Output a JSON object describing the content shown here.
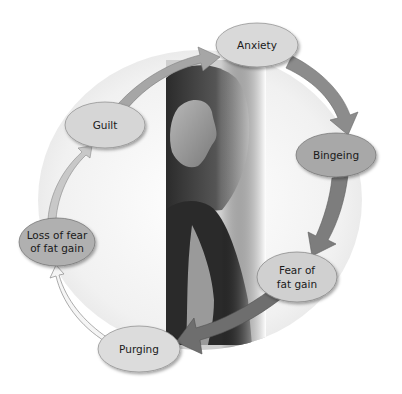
{
  "diagram": {
    "type": "cycle",
    "nodes": [
      {
        "id": "anxiety",
        "label": "Anxiety",
        "lines": [
          "Anxiety"
        ],
        "fill": "#d9d9d9"
      },
      {
        "id": "bingeing",
        "label": "Bingeing",
        "lines": [
          "Bingeing"
        ],
        "fill": "#a8a8a8"
      },
      {
        "id": "fear",
        "label": "Fear of fat gain",
        "lines": [
          "Fear of",
          "fat gain"
        ],
        "fill": "#d0d0d0"
      },
      {
        "id": "purging",
        "label": "Purging",
        "lines": [
          "Purging"
        ],
        "fill": "#dcdcdc"
      },
      {
        "id": "loss",
        "label": "Loss of fear of fat gain",
        "lines": [
          "Loss of fear",
          "of fat gain"
        ],
        "fill": "#b0b0b0"
      },
      {
        "id": "guilt",
        "label": "Guilt",
        "lines": [
          "Guilt"
        ],
        "fill": "#d6d6d6"
      }
    ],
    "edges": [
      {
        "from": "anxiety",
        "to": "bingeing",
        "shade": "#8c8c8c"
      },
      {
        "from": "bingeing",
        "to": "fear",
        "shade": "#7d7d7d"
      },
      {
        "from": "fear",
        "to": "purging",
        "shade": "#6e6e6e"
      },
      {
        "from": "purging",
        "to": "loss",
        "shade": "#f2f2f2"
      },
      {
        "from": "loss",
        "to": "guilt",
        "shade": "#c8c8c8"
      },
      {
        "from": "guilt",
        "to": "anxiety",
        "shade": "#a6a6a6"
      }
    ],
    "center_image": "grayscale-photo-of-young-woman"
  }
}
